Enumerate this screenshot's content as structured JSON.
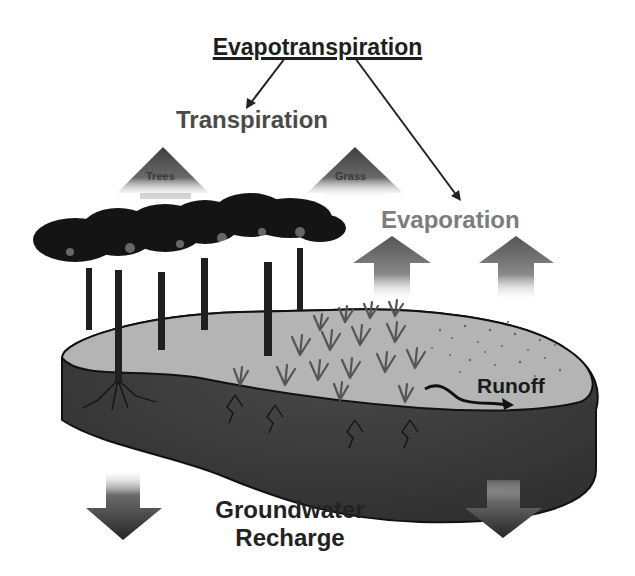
{
  "diagram": {
    "title": "Evapotranspiration",
    "labels": {
      "transpiration": "Transpiration",
      "trees": "Trees",
      "grass": "Grass",
      "evaporation": "Evaporation",
      "runoff": "Runoff",
      "groundwater_line1": "Groundwater",
      "groundwater_line2": "Recharge"
    },
    "arrows": [
      {
        "name": "title-to-transpiration",
        "from": "Evapotranspiration",
        "to": "Transpiration"
      },
      {
        "name": "title-to-evaporation",
        "from": "Evapotranspiration",
        "to": "Evaporation"
      },
      {
        "name": "transpiration-trees-up",
        "direction": "up"
      },
      {
        "name": "transpiration-grass-up",
        "direction": "up"
      },
      {
        "name": "evaporation-left-up",
        "direction": "up"
      },
      {
        "name": "evaporation-right-up",
        "direction": "up"
      },
      {
        "name": "runoff-flow",
        "direction": "right"
      },
      {
        "name": "recharge-left-down",
        "direction": "down"
      },
      {
        "name": "recharge-right-down",
        "direction": "down"
      }
    ],
    "colors": {
      "ground_surface": "#b4b4b4",
      "soil_layer": "#3c3c3c",
      "trees": "#1a1a1a",
      "arrow_dark": "#3a3a3a"
    }
  }
}
